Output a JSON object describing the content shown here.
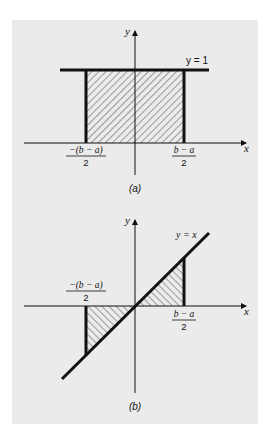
{
  "colors": {
    "page_background": "#ffffff",
    "panel_background": "#ebebeb",
    "ink": "#111111",
    "hatch": "#555555"
  },
  "panel_a": {
    "caption": "(a)",
    "y_axis_label": "y",
    "x_axis_label": "x",
    "curve_label": "y = 1",
    "left_label_numerator": "−(b − a)",
    "left_label_denominator": "2",
    "right_label_numerator": "b − a",
    "right_label_denominator": "2",
    "shaded_region": "rectangle from x = −(b−a)/2 to (b−a)/2 under y = 1",
    "hatch_direction": "/"
  },
  "panel_b": {
    "caption": "(b)",
    "y_axis_label": "y",
    "x_axis_label": "x",
    "curve_label": "y = x",
    "left_label_numerator": "−(b − a)",
    "left_label_denominator": "2",
    "right_label_numerator": "b − a",
    "right_label_denominator": "2",
    "shaded_region": "two triangles between y = x and x-axis over [−(b−a)/2, (b−a)/2]",
    "hatch_direction": "\\"
  }
}
